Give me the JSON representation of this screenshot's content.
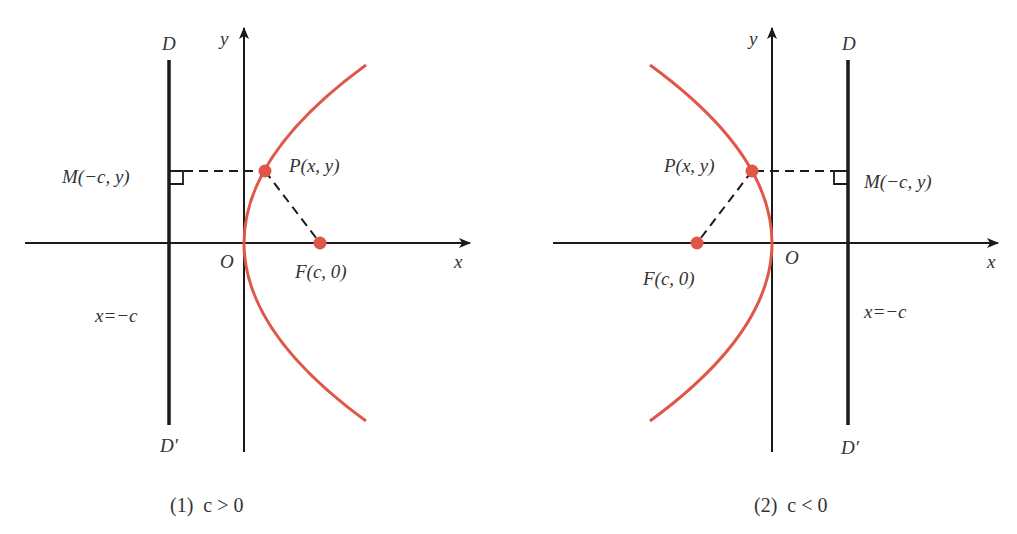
{
  "colors": {
    "curve": "#e0574a",
    "axis": "#1a1a1a",
    "text": "#333333"
  },
  "figures": [
    {
      "id": "fig1",
      "caption": "(1)  c > 0",
      "labels": {
        "directrix_top": "D",
        "directrix_bottom": "D′",
        "y_axis": "y",
        "x_axis": "x",
        "origin": "O",
        "point_p": "P(x,  y)",
        "point_m": "M(−c,  y)",
        "focus": "F(c,  0)",
        "directrix_eq": "x=−c"
      }
    },
    {
      "id": "fig2",
      "caption": "(2)  c < 0",
      "labels": {
        "directrix_top": "D",
        "directrix_bottom": "D′",
        "y_axis": "y",
        "x_axis": "x",
        "origin": "O",
        "point_p": "P(x,  y)",
        "point_m": "M(−c,  y)",
        "focus": "F(c,  0)",
        "directrix_eq": "x=−c"
      }
    }
  ]
}
